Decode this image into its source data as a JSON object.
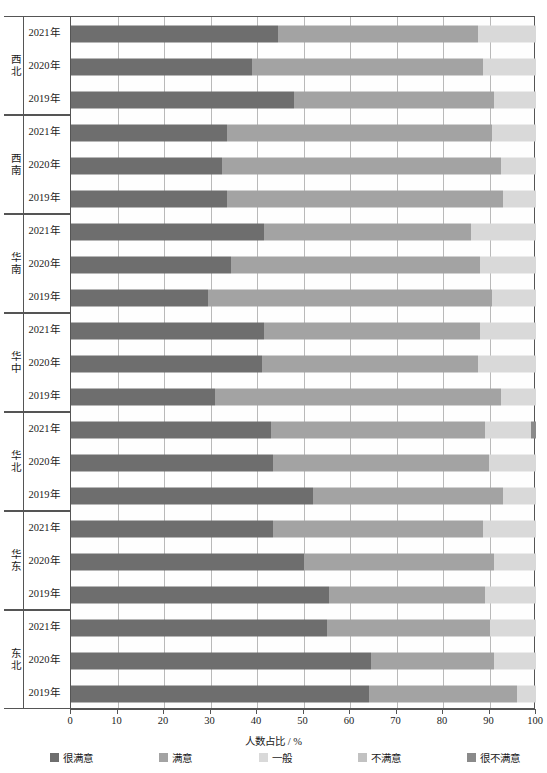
{
  "chart_data": {
    "type": "bar",
    "orientation": "horizontal",
    "stacked": true,
    "stack_mode": "percent",
    "title": "",
    "xlabel": "人数占比 / %",
    "ylabel": "",
    "xlim": [
      0,
      100
    ],
    "xticks": [
      0,
      10,
      20,
      30,
      40,
      50,
      60,
      70,
      80,
      90,
      100
    ],
    "xtick_labels": [
      "0",
      "10",
      "20",
      "30",
      "40",
      "50",
      "60",
      "70",
      "80",
      "90",
      "100"
    ],
    "grid": "vertical",
    "legend_position": "bottom",
    "legend": [
      "很满意",
      "满意",
      "一般",
      "不满意",
      "很不满意"
    ],
    "colors": [
      "#6e6e6e",
      "#a3a3a3",
      "#d9d9d9",
      "#c2c2c2",
      "#8a8a8a"
    ],
    "group_label_field": "region",
    "category_label_field": "year",
    "groups": [
      {
        "region": "西北",
        "rows": [
          {
            "year": "2021年",
            "values": [
              44.5,
              43.0,
              12.5,
              0.0,
              0.0
            ]
          },
          {
            "year": "2020年",
            "values": [
              39.0,
              49.5,
              11.5,
              0.0,
              0.0
            ]
          },
          {
            "year": "2019年",
            "values": [
              48.0,
              43.0,
              9.0,
              0.0,
              0.0
            ]
          }
        ]
      },
      {
        "region": "西南",
        "rows": [
          {
            "year": "2021年",
            "values": [
              33.5,
              57.0,
              9.5,
              0.0,
              0.0
            ]
          },
          {
            "year": "2020年",
            "values": [
              32.5,
              60.0,
              7.5,
              0.0,
              0.0
            ]
          },
          {
            "year": "2019年",
            "values": [
              33.5,
              59.5,
              7.0,
              0.0,
              0.0
            ]
          }
        ]
      },
      {
        "region": "华南",
        "rows": [
          {
            "year": "2021年",
            "values": [
              41.5,
              44.5,
              14.0,
              0.0,
              0.0
            ]
          },
          {
            "year": "2020年",
            "values": [
              34.5,
              53.5,
              12.0,
              0.0,
              0.0
            ]
          },
          {
            "year": "2019年",
            "values": [
              29.5,
              61.0,
              9.5,
              0.0,
              0.0
            ]
          }
        ]
      },
      {
        "region": "华中",
        "rows": [
          {
            "year": "2021年",
            "values": [
              41.5,
              46.5,
              12.0,
              0.0,
              0.0
            ]
          },
          {
            "year": "2020年",
            "values": [
              41.0,
              46.5,
              12.5,
              0.0,
              0.0
            ]
          },
          {
            "year": "2019年",
            "values": [
              31.0,
              61.5,
              7.5,
              0.0,
              0.0
            ]
          }
        ]
      },
      {
        "region": "华北",
        "rows": [
          {
            "year": "2021年",
            "values": [
              43.0,
              46.0,
              10.0,
              0.0,
              1.0
            ]
          },
          {
            "year": "2020年",
            "values": [
              43.5,
              46.5,
              10.0,
              0.0,
              0.0
            ]
          },
          {
            "year": "2019年",
            "values": [
              52.0,
              41.0,
              7.0,
              0.0,
              0.0
            ]
          }
        ]
      },
      {
        "region": "华东",
        "rows": [
          {
            "year": "2021年",
            "values": [
              43.5,
              45.0,
              11.5,
              0.0,
              0.0
            ]
          },
          {
            "year": "2020年",
            "values": [
              50.0,
              41.0,
              9.0,
              0.0,
              0.0
            ]
          },
          {
            "year": "2019年",
            "values": [
              55.5,
              33.5,
              11.0,
              0.0,
              0.0
            ]
          }
        ]
      },
      {
        "region": "东北",
        "rows": [
          {
            "year": "2021年",
            "values": [
              55.0,
              35.0,
              10.0,
              0.0,
              0.0
            ]
          },
          {
            "year": "2020年",
            "values": [
              64.5,
              26.5,
              9.0,
              0.0,
              0.0
            ]
          },
          {
            "year": "2019年",
            "values": [
              64.0,
              32.0,
              4.0,
              0.0,
              0.0
            ]
          }
        ]
      }
    ]
  },
  "axis": {
    "x_title": "人数占比 / %"
  }
}
